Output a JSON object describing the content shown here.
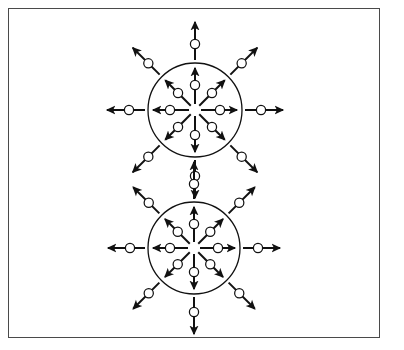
{
  "figure": {
    "title": "Two-centre radial expansion diagram",
    "caption": "",
    "background_color": "#ffffff",
    "frame": {
      "name": "figure-border",
      "stroke_color": "#4a4a4a",
      "stroke_width": 1.6,
      "x": 8,
      "y": 8,
      "width": 372,
      "height": 330
    },
    "stroke_color": "#111111",
    "particle_fill": "#ffffff",
    "particle_stroke": "#111111",
    "arrow_stroke_width": 2.0,
    "circle_stroke_width": 1.3,
    "particle_radius": 4.6
  },
  "chart_data": {
    "type": "diagram",
    "title": "Two-centre radial expansion diagram",
    "units": "pixels",
    "clusters": [
      {
        "name": "upper-cluster",
        "label": "Upper expansion centre",
        "center": [
          195,
          110
        ],
        "radius": 47,
        "inner_arrow_count": 8,
        "outer_arrow_count": 8,
        "inner_arrows": [
          {
            "angle_deg": 90,
            "start_r": 6,
            "end_r": 42,
            "particle_r": 25
          },
          {
            "angle_deg": 45,
            "start_r": 6,
            "end_r": 42,
            "particle_r": 24
          },
          {
            "angle_deg": 0,
            "start_r": 6,
            "end_r": 42,
            "particle_r": 25
          },
          {
            "angle_deg": 315,
            "start_r": 6,
            "end_r": 42,
            "particle_r": 24
          },
          {
            "angle_deg": 270,
            "start_r": 6,
            "end_r": 42,
            "particle_r": 25
          },
          {
            "angle_deg": 225,
            "start_r": 6,
            "end_r": 42,
            "particle_r": 24
          },
          {
            "angle_deg": 180,
            "start_r": 6,
            "end_r": 42,
            "particle_r": 25
          },
          {
            "angle_deg": 135,
            "start_r": 6,
            "end_r": 42,
            "particle_r": 24
          }
        ],
        "outer_arrows": [
          {
            "angle_deg": 90,
            "start_r": 50,
            "end_r": 88,
            "particle_r": 66
          },
          {
            "angle_deg": 45,
            "start_r": 50,
            "end_r": 88,
            "particle_r": 66
          },
          {
            "angle_deg": 0,
            "start_r": 50,
            "end_r": 88,
            "particle_r": 66
          },
          {
            "angle_deg": 315,
            "start_r": 50,
            "end_r": 88,
            "particle_r": 66
          },
          {
            "angle_deg": 270,
            "start_r": 50,
            "end_r": 88,
            "particle_r": 66
          },
          {
            "angle_deg": 225,
            "start_r": 50,
            "end_r": 88,
            "particle_r": 66
          },
          {
            "angle_deg": 180,
            "start_r": 50,
            "end_r": 88,
            "particle_r": 66
          },
          {
            "angle_deg": 135,
            "start_r": 50,
            "end_r": 88,
            "particle_r": 66
          }
        ]
      },
      {
        "name": "lower-cluster",
        "label": "Lower expansion centre",
        "center": [
          194,
          248
        ],
        "radius": 46,
        "inner_arrow_count": 8,
        "outer_arrow_count": 8,
        "inner_arrows": [
          {
            "angle_deg": 90,
            "start_r": 6,
            "end_r": 41,
            "particle_r": 24
          },
          {
            "angle_deg": 45,
            "start_r": 6,
            "end_r": 41,
            "particle_r": 23
          },
          {
            "angle_deg": 0,
            "start_r": 6,
            "end_r": 41,
            "particle_r": 24
          },
          {
            "angle_deg": 315,
            "start_r": 6,
            "end_r": 41,
            "particle_r": 23
          },
          {
            "angle_deg": 270,
            "start_r": 6,
            "end_r": 41,
            "particle_r": 24
          },
          {
            "angle_deg": 225,
            "start_r": 6,
            "end_r": 41,
            "particle_r": 23
          },
          {
            "angle_deg": 180,
            "start_r": 6,
            "end_r": 41,
            "particle_r": 24
          },
          {
            "angle_deg": 135,
            "start_r": 6,
            "end_r": 41,
            "particle_r": 23
          }
        ],
        "outer_arrows": [
          {
            "angle_deg": 90,
            "start_r": 49,
            "end_r": 86,
            "particle_r": 64
          },
          {
            "angle_deg": 45,
            "start_r": 49,
            "end_r": 86,
            "particle_r": 64
          },
          {
            "angle_deg": 0,
            "start_r": 49,
            "end_r": 86,
            "particle_r": 64
          },
          {
            "angle_deg": 315,
            "start_r": 49,
            "end_r": 86,
            "particle_r": 64
          },
          {
            "angle_deg": 270,
            "start_r": 49,
            "end_r": 86,
            "particle_r": 64
          },
          {
            "angle_deg": 225,
            "start_r": 49,
            "end_r": 86,
            "particle_r": 64
          },
          {
            "angle_deg": 180,
            "start_r": 49,
            "end_r": 86,
            "particle_r": 64
          },
          {
            "angle_deg": 135,
            "start_r": 49,
            "end_r": 86,
            "particle_r": 64
          }
        ]
      }
    ],
    "totals": {
      "circles": 2,
      "arrows": 32,
      "particles": 32
    }
  }
}
